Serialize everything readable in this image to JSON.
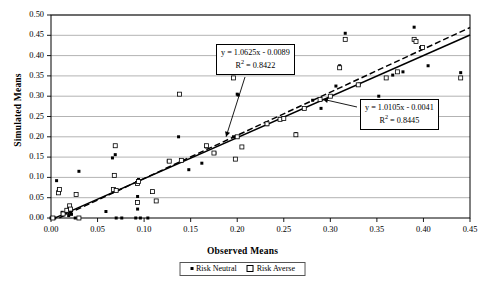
{
  "chart_data": {
    "type": "scatter",
    "title": "",
    "xlabel": "Observed Means",
    "ylabel": "Simulated Means",
    "xlim": [
      0.0,
      0.45
    ],
    "ylim": [
      0.0,
      0.5
    ],
    "xticks": [
      "0.00",
      "0.05",
      "0.10",
      "0.15",
      "0.20",
      "0.25",
      "0.30",
      "0.35",
      "0.40",
      "0.45"
    ],
    "xtick_values": [
      0.0,
      0.05,
      0.1,
      0.15,
      0.2,
      0.25,
      0.3,
      0.35,
      0.4,
      0.45
    ],
    "yticks": [
      "0.00",
      "0.05",
      "0.10",
      "0.15",
      "0.20",
      "0.25",
      "0.30",
      "0.35",
      "0.40",
      "0.45",
      "0.50"
    ],
    "ytick_values": [
      0.0,
      0.05,
      0.1,
      0.15,
      0.2,
      0.25,
      0.3,
      0.35,
      0.4,
      0.45,
      0.5
    ],
    "grid": "horizontal",
    "legend_position": "bottom-center",
    "series": [
      {
        "name": "Risk Neutral",
        "marker": "filled",
        "points": [
          [
            0.0,
            0.0
          ],
          [
            0.004,
            0.0
          ],
          [
            0.006,
            0.092
          ],
          [
            0.008,
            0.07
          ],
          [
            0.009,
            0.065
          ],
          [
            0.012,
            0.014
          ],
          [
            0.016,
            0.012
          ],
          [
            0.018,
            0.02
          ],
          [
            0.019,
            0.006
          ],
          [
            0.021,
            0.016
          ],
          [
            0.022,
            0.009
          ],
          [
            0.026,
            0.0
          ],
          [
            0.03,
            0.115
          ],
          [
            0.03,
            0.0
          ],
          [
            0.059,
            0.016
          ],
          [
            0.066,
            0.148
          ],
          [
            0.068,
            0.068
          ],
          [
            0.069,
            0.156
          ],
          [
            0.07,
            0.0
          ],
          [
            0.076,
            0.0
          ],
          [
            0.091,
            0.0
          ],
          [
            0.093,
            0.053
          ],
          [
            0.093,
            0.022
          ],
          [
            0.094,
            0.095
          ],
          [
            0.096,
            0.0
          ],
          [
            0.104,
            0.0
          ],
          [
            0.126,
            0.14
          ],
          [
            0.137,
            0.2
          ],
          [
            0.148,
            0.119
          ],
          [
            0.162,
            0.135
          ],
          [
            0.167,
            0.175
          ],
          [
            0.176,
            0.16
          ],
          [
            0.196,
            0.2
          ],
          [
            0.2,
            0.305
          ],
          [
            0.201,
            0.303
          ],
          [
            0.232,
            0.23
          ],
          [
            0.249,
            0.247
          ],
          [
            0.263,
            0.208
          ],
          [
            0.272,
            0.27
          ],
          [
            0.281,
            0.29
          ],
          [
            0.29,
            0.27
          ],
          [
            0.306,
            0.325
          ],
          [
            0.31,
            0.375
          ],
          [
            0.316,
            0.455
          ],
          [
            0.331,
            0.33
          ],
          [
            0.352,
            0.3
          ],
          [
            0.367,
            0.352
          ],
          [
            0.378,
            0.36
          ],
          [
            0.39,
            0.47
          ],
          [
            0.392,
            0.435
          ],
          [
            0.397,
            0.42
          ],
          [
            0.405,
            0.375
          ],
          [
            0.44,
            0.358
          ]
        ]
      },
      {
        "name": "Risk Averse",
        "marker": "open",
        "points": [
          [
            0.002,
            0.0
          ],
          [
            0.008,
            0.062
          ],
          [
            0.009,
            0.07
          ],
          [
            0.013,
            0.01
          ],
          [
            0.017,
            0.019
          ],
          [
            0.02,
            0.03
          ],
          [
            0.021,
            0.022
          ],
          [
            0.027,
            0.058
          ],
          [
            0.03,
            0.0
          ],
          [
            0.067,
            0.07
          ],
          [
            0.068,
            0.105
          ],
          [
            0.069,
            0.178
          ],
          [
            0.07,
            0.068
          ],
          [
            0.093,
            0.085
          ],
          [
            0.093,
            0.038
          ],
          [
            0.094,
            0.09
          ],
          [
            0.109,
            0.065
          ],
          [
            0.113,
            0.042
          ],
          [
            0.127,
            0.14
          ],
          [
            0.138,
            0.305
          ],
          [
            0.14,
            0.142
          ],
          [
            0.167,
            0.178
          ],
          [
            0.175,
            0.16
          ],
          [
            0.196,
            0.345
          ],
          [
            0.198,
            0.145
          ],
          [
            0.2,
            0.2
          ],
          [
            0.205,
            0.175
          ],
          [
            0.232,
            0.232
          ],
          [
            0.246,
            0.243
          ],
          [
            0.25,
            0.245
          ],
          [
            0.263,
            0.205
          ],
          [
            0.272,
            0.27
          ],
          [
            0.289,
            0.292
          ],
          [
            0.3,
            0.3
          ],
          [
            0.31,
            0.37
          ],
          [
            0.316,
            0.44
          ],
          [
            0.33,
            0.328
          ],
          [
            0.36,
            0.345
          ],
          [
            0.372,
            0.36
          ],
          [
            0.39,
            0.44
          ],
          [
            0.392,
            0.435
          ],
          [
            0.399,
            0.42
          ],
          [
            0.44,
            0.345
          ]
        ]
      }
    ],
    "trendlines": [
      {
        "name": "dashed-trendline",
        "style": "dashed",
        "slope": 1.0625,
        "intercept": -0.0089,
        "equation": "y = 1.0625x - 0.0089",
        "r2_label": "R",
        "r2_value": "= 0.8422",
        "r2_exp": "2"
      },
      {
        "name": "solid-trendline",
        "style": "solid",
        "slope": 1.0105,
        "intercept": -0.0041,
        "equation": "y = 1.0105x - 0.0041",
        "r2_label": "R",
        "r2_value": "= 0.8445",
        "r2_exp": "2"
      }
    ],
    "annotations": [
      {
        "name": "dashed-equation-callout",
        "text": "y = 1.0625x - 0.0089",
        "arrow_to": [
          0.188,
          0.205
        ]
      },
      {
        "name": "solid-equation-callout",
        "text": "y = 1.0105x - 0.0041",
        "arrow_to": [
          0.29,
          0.289
        ]
      }
    ]
  },
  "legend": {
    "items": [
      {
        "label": "Risk Neutral",
        "marker": "filled"
      },
      {
        "label": "Risk Averse",
        "marker": "open"
      }
    ]
  },
  "colors": {
    "axis": "#000000",
    "grid": "#808080",
    "marker": "#000000",
    "trendline": "#000000",
    "background": "#ffffff"
  }
}
